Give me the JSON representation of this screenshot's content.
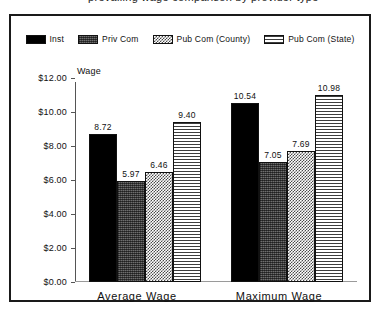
{
  "top_cutoff_text": "prevailing wage comparison by provider type",
  "chart_data": {
    "type": "bar",
    "title": "",
    "xlabel": "",
    "ylabel": "Wage",
    "categories": [
      "Average Wage",
      "Maximum Wage"
    ],
    "ylim": [
      0,
      12
    ],
    "ytick_labels": [
      "$0.00",
      "$2.00",
      "$4.00",
      "$6.00",
      "$8.00",
      "$10.00",
      "$12.00"
    ],
    "ytick_values": [
      0,
      2,
      4,
      6,
      8,
      10,
      12
    ],
    "grid": false,
    "legend_position": "top",
    "series": [
      {
        "name": "Inst",
        "pattern": "solid-black",
        "values": [
          8.72,
          10.54
        ],
        "labels": [
          "8.72",
          "10.54"
        ]
      },
      {
        "name": "Priv Com",
        "pattern": "dark-dither",
        "values": [
          5.97,
          7.05
        ],
        "labels": [
          "5.97",
          "7.05"
        ]
      },
      {
        "name": "Pub Com (County)",
        "pattern": "checkerboard",
        "values": [
          6.46,
          7.69
        ],
        "labels": [
          "6.46",
          "7.69"
        ]
      },
      {
        "name": "Pub Com (State)",
        "pattern": "horizontal-stripes",
        "values": [
          9.4,
          10.98
        ],
        "labels": [
          "9.40",
          "10.98"
        ]
      }
    ]
  },
  "colors": {
    "frame": "#1a1a1a",
    "axis": "#555555",
    "text": "#111111",
    "background": "#ffffff"
  }
}
